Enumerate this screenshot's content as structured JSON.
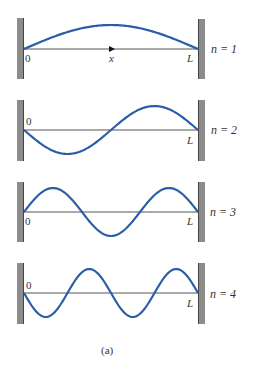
{
  "figure": {
    "caption": "(a)",
    "wave_color": "#2b5ea7",
    "wall_color": "#8c8c8c",
    "axis_label_start": "0",
    "axis_label_end": "L",
    "axis_variable": "x",
    "panels": [
      {
        "mode_label": "n = 1",
        "n": 1,
        "start_sign": 1
      },
      {
        "mode_label": "n = 2",
        "n": 2,
        "start_sign": -1
      },
      {
        "mode_label": "n = 3",
        "n": 3,
        "start_sign": 1
      },
      {
        "mode_label": "n = 4",
        "n": 4,
        "start_sign": -1
      }
    ]
  }
}
